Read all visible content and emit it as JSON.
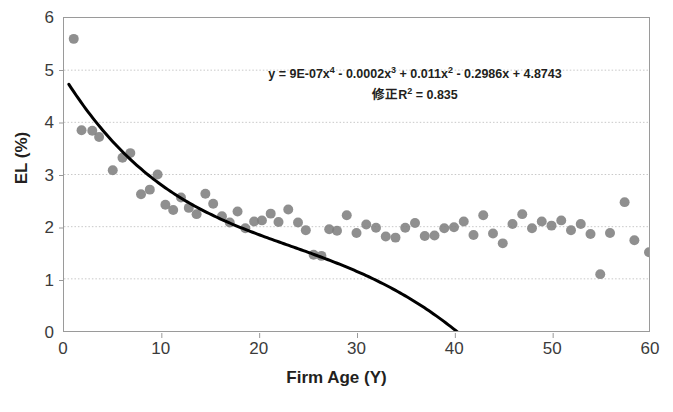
{
  "chart_data": {
    "type": "scatter",
    "title": "",
    "xlabel": "Firm Age (Y)",
    "ylabel": "EL (%)",
    "xlim": [
      0,
      60
    ],
    "ylim": [
      0,
      6
    ],
    "xticks": [
      0,
      10,
      20,
      30,
      40,
      50,
      60
    ],
    "yticks": [
      0,
      1,
      2,
      3,
      4,
      5,
      6
    ],
    "grid": "horizontal-dotted",
    "legend": "none",
    "marker_color": "#7f7f7f",
    "trendline_color": "#000000",
    "annotations": [
      "y = 9E-07x⁴ - 0.0002x³ + 0.011x² - 0.2986x + 4.8743",
      "修正R² = 0.835"
    ],
    "equation_line1_parts": {
      "a": "y = 9E-07x",
      "a_sup": "4",
      "b": " - 0.0002x",
      "b_sup": "3",
      "c": " + 0.011x",
      "c_sup": "2",
      "d": " - 0.2986x + 4.8743"
    },
    "equation_line2_parts": {
      "a": "修正R",
      "a_sup": "2",
      "b": " = 0.835"
    },
    "trendline": {
      "type": "polynomial",
      "degree": 4,
      "coefficients": [
        9e-07,
        -0.0002,
        0.011,
        -0.2986,
        4.8743
      ],
      "r_squared_adjusted": 0.835
    },
    "points": [
      [
        1.0,
        5.6
      ],
      [
        1.8,
        3.85
      ],
      [
        2.9,
        3.84
      ],
      [
        3.6,
        3.72
      ],
      [
        5.0,
        3.08
      ],
      [
        6.0,
        3.32
      ],
      [
        6.8,
        3.41
      ],
      [
        7.9,
        2.62
      ],
      [
        8.8,
        2.71
      ],
      [
        9.6,
        3.0
      ],
      [
        10.4,
        2.42
      ],
      [
        11.2,
        2.32
      ],
      [
        12.0,
        2.56
      ],
      [
        12.8,
        2.36
      ],
      [
        13.6,
        2.24
      ],
      [
        14.5,
        2.63
      ],
      [
        15.3,
        2.44
      ],
      [
        16.2,
        2.2
      ],
      [
        17.0,
        2.08
      ],
      [
        17.8,
        2.29
      ],
      [
        18.6,
        1.97
      ],
      [
        19.5,
        2.1
      ],
      [
        20.3,
        2.12
      ],
      [
        21.2,
        2.25
      ],
      [
        22.0,
        2.09
      ],
      [
        23.0,
        2.33
      ],
      [
        24.0,
        2.08
      ],
      [
        24.8,
        1.93
      ],
      [
        25.6,
        1.46
      ],
      [
        26.4,
        1.44
      ],
      [
        27.2,
        1.95
      ],
      [
        28.0,
        1.92
      ],
      [
        29.0,
        2.22
      ],
      [
        30.0,
        1.88
      ],
      [
        31.0,
        2.04
      ],
      [
        32.0,
        1.98
      ],
      [
        33.0,
        1.81
      ],
      [
        34.0,
        1.79
      ],
      [
        35.0,
        1.98
      ],
      [
        36.0,
        2.07
      ],
      [
        37.0,
        1.82
      ],
      [
        38.0,
        1.83
      ],
      [
        39.0,
        1.97
      ],
      [
        40.0,
        1.99
      ],
      [
        41.0,
        2.1
      ],
      [
        42.0,
        1.84
      ],
      [
        43.0,
        2.22
      ],
      [
        44.0,
        1.87
      ],
      [
        45.0,
        1.68
      ],
      [
        46.0,
        2.05
      ],
      [
        47.0,
        2.24
      ],
      [
        48.0,
        1.97
      ],
      [
        49.0,
        2.1
      ],
      [
        50.0,
        2.02
      ],
      [
        51.0,
        2.12
      ],
      [
        52.0,
        1.93
      ],
      [
        53.0,
        2.05
      ],
      [
        54.0,
        1.86
      ],
      [
        55.0,
        1.09
      ],
      [
        56.0,
        1.88
      ],
      [
        57.5,
        2.47
      ],
      [
        58.5,
        1.74
      ],
      [
        60.0,
        1.51
      ]
    ]
  }
}
